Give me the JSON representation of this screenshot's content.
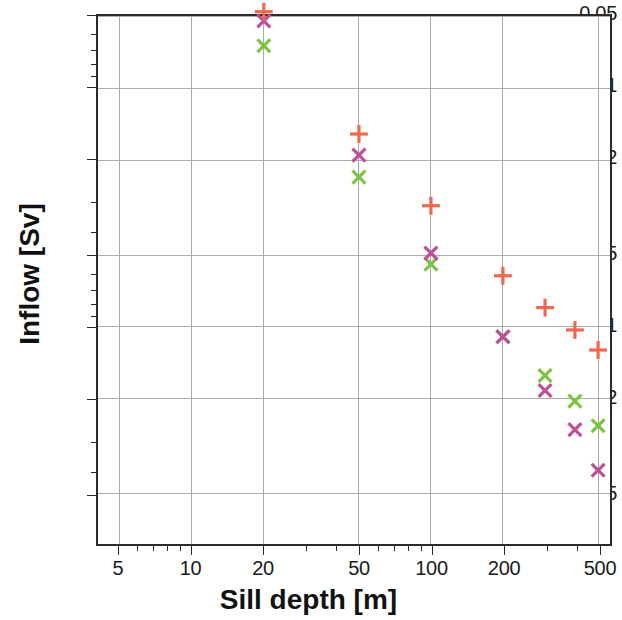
{
  "chart_data": {
    "type": "scatter",
    "title": "",
    "xlabel": "Sill depth [m]",
    "ylabel": "Inflow [Sv]",
    "xscale": "log",
    "yscale": "log",
    "xlim": [
      4.0,
      560
    ],
    "ylim": [
      0.026,
      5.0
    ],
    "grid": true,
    "legend": "none",
    "xticks": [
      5,
      10,
      20,
      50,
      100,
      200,
      500
    ],
    "xticklabels": [
      "5",
      "10",
      "20",
      "50",
      "100",
      "200",
      "500"
    ],
    "yticks": [
      0.05,
      0.1,
      0.2,
      0.5,
      1,
      2,
      5
    ],
    "yticklabels": [
      "0.05",
      "0.1",
      "0.2",
      "0.5",
      "1",
      "2",
      "5"
    ],
    "series": [
      {
        "name": "green-crosses",
        "marker": "x",
        "color": "#7DC242",
        "points": [
          {
            "x": 20,
            "y": 0.066
          },
          {
            "x": 50,
            "y": 0.235
          },
          {
            "x": 100,
            "y": 0.545
          },
          {
            "x": 200,
            "y": 1.1
          },
          {
            "x": 300,
            "y": 1.6
          },
          {
            "x": 400,
            "y": 2.05
          },
          {
            "x": 500,
            "y": 2.6
          }
        ]
      },
      {
        "name": "magenta-crosses",
        "marker": "x",
        "color": "#BD4F99",
        "points": [
          {
            "x": 20,
            "y": 0.052
          },
          {
            "x": 50,
            "y": 0.19
          },
          {
            "x": 100,
            "y": 0.49
          },
          {
            "x": 200,
            "y": 1.1
          },
          {
            "x": 300,
            "y": 1.85
          },
          {
            "x": 400,
            "y": 2.7
          },
          {
            "x": 500,
            "y": 4.0
          }
        ]
      },
      {
        "name": "orange-plus",
        "marker": "+",
        "color": "#EF674E",
        "points": [
          {
            "x": 5,
            "y": 0.0335
          },
          {
            "x": 10,
            "y": 0.035
          },
          {
            "x": 20,
            "y": 0.0475
          },
          {
            "x": 50,
            "y": 0.155
          },
          {
            "x": 100,
            "y": 0.31
          },
          {
            "x": 200,
            "y": 0.61
          },
          {
            "x": 300,
            "y": 0.83
          },
          {
            "x": 400,
            "y": 1.03
          },
          {
            "x": 500,
            "y": 1.25
          }
        ]
      },
      {
        "name": "blue-plus",
        "marker": "+",
        "color": "#6B6BC4",
        "points": [
          {
            "x": 20,
            "y": 0.0335
          },
          {
            "x": 50,
            "y": 0.0335
          },
          {
            "x": 100,
            "y": 0.0335
          },
          {
            "x": 200,
            "y": 0.0335
          },
          {
            "x": 300,
            "y": 0.0335
          },
          {
            "x": 400,
            "y": 0.0335
          },
          {
            "x": 500,
            "y": 0.0335
          }
        ]
      }
    ],
    "minor_yticks": [
      0.03,
      0.04,
      0.06,
      0.07,
      0.08,
      0.09,
      0.3,
      0.4,
      0.6,
      0.7,
      0.8,
      0.9,
      3,
      4
    ],
    "minor_xticks": [
      6,
      7,
      8,
      9,
      30,
      40,
      60,
      70,
      80,
      90,
      300,
      400
    ],
    "gridline_color": "#a9a9a9",
    "axis_color": "#2b2b2b",
    "background": "#ffffff"
  }
}
